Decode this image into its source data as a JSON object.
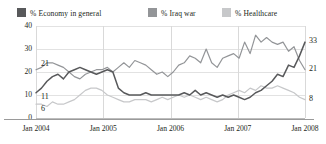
{
  "legend": {
    "items": [
      {
        "label": "% Economy in general",
        "color": "#58595b",
        "key": "economy"
      },
      {
        "label": "% Iraq war",
        "color": "#939598",
        "key": "iraq"
      },
      {
        "label": "% Healthcare",
        "color": "#c7c8ca",
        "key": "healthcare"
      }
    ]
  },
  "annotations": {
    "start": [
      {
        "text": "21",
        "series": "iraq"
      },
      {
        "text": "11",
        "series": "economy"
      },
      {
        "text": "6",
        "series": "healthcare"
      }
    ],
    "end": [
      {
        "text": "33",
        "series": "economy"
      },
      {
        "text": "21",
        "series": "iraq"
      },
      {
        "text": "8",
        "series": "healthcare"
      }
    ]
  },
  "chart_data": {
    "type": "line",
    "title": "",
    "xlabel": "",
    "ylabel": "",
    "ylim": [
      0,
      40
    ],
    "yticks": [
      0,
      10,
      20,
      30,
      40
    ],
    "xticks": [
      "Jan 2004",
      "Jan 2005",
      "Jan 2006",
      "Jan 2007",
      "Jan 2008"
    ],
    "xlim": [
      0,
      48
    ],
    "grid": true,
    "legend_position": "top",
    "series": [
      {
        "name": "% Economy in general",
        "color": "#58595b",
        "values": [
          11,
          13,
          16,
          18,
          19,
          17,
          20,
          21,
          22,
          21,
          20,
          19,
          20,
          21,
          20,
          13,
          11,
          10,
          10,
          10,
          11,
          10,
          10,
          10,
          10,
          10,
          10,
          11,
          10,
          12,
          10,
          11,
          10,
          9,
          10,
          9,
          10,
          9,
          8,
          9,
          11,
          12,
          14,
          16,
          19,
          18,
          23,
          22,
          27,
          33
        ]
      },
      {
        "name": "% Iraq war",
        "color": "#939598",
        "values": [
          21,
          22,
          24,
          24,
          23,
          22,
          20,
          18,
          17,
          19,
          20,
          21,
          21,
          22,
          20,
          22,
          24,
          22,
          25,
          24,
          23,
          21,
          19,
          20,
          18,
          20,
          23,
          24,
          27,
          26,
          24,
          30,
          24,
          22,
          26,
          27,
          28,
          26,
          33,
          28,
          36,
          33,
          35,
          33,
          32,
          33,
          29,
          31,
          25,
          21
        ]
      },
      {
        "name": "% Healthcare",
        "color": "#c7c8ca",
        "values": [
          6,
          6,
          5,
          7,
          6,
          6,
          7,
          8,
          10,
          12,
          13,
          13,
          12,
          10,
          9,
          8,
          7,
          7,
          8,
          8,
          8,
          7,
          8,
          9,
          8,
          9,
          10,
          9,
          10,
          9,
          8,
          9,
          8,
          7,
          8,
          10,
          11,
          12,
          11,
          13,
          12,
          14,
          13,
          13,
          14,
          13,
          12,
          11,
          9,
          8
        ]
      }
    ]
  }
}
